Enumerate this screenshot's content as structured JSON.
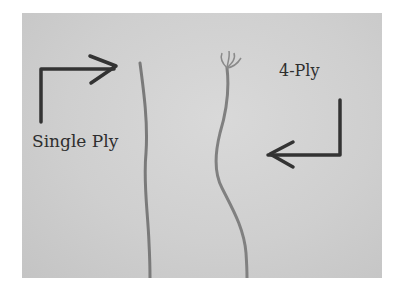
{
  "image": {
    "description": "Photo comparing a single ply yarn strand and a 4-ply yarn strand on a grey background",
    "labels": {
      "single": "Single Ply",
      "four": "4-Ply"
    },
    "colors": {
      "background": "#cfcfcf",
      "annotation": "#2e2e2e",
      "yarn": "#7a7a7a"
    }
  }
}
